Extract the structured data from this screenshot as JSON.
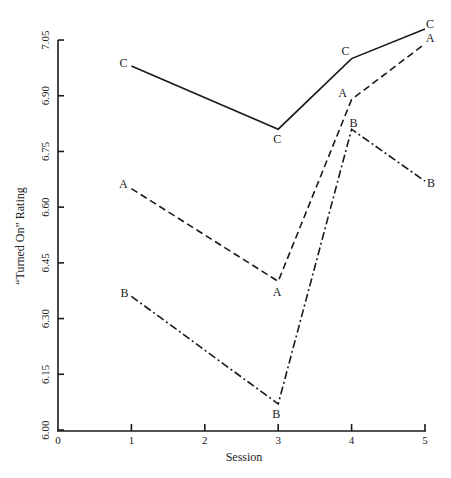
{
  "chart_data": {
    "type": "line",
    "title": "",
    "xlabel": "Session",
    "ylabel": "“Turned On” Rating",
    "xlim": [
      0,
      5
    ],
    "ylim": [
      6.0,
      7.05
    ],
    "x_ticks": [
      "0",
      "1",
      "2",
      "3",
      "4",
      "5"
    ],
    "y_ticks": [
      "6.00",
      "6.15",
      "6.30",
      "6.45",
      "6.60",
      "6.75",
      "6.90",
      "7.05"
    ],
    "grid": false,
    "legend": "none (series labeled inline at each point with letters A, B, C)",
    "x": [
      1,
      3,
      4,
      5
    ],
    "series": [
      {
        "name": "C",
        "style": "solid",
        "values": [
          6.98,
          6.81,
          7.0,
          7.08
        ]
      },
      {
        "name": "A",
        "style": "dashed",
        "values": [
          6.65,
          6.4,
          6.89,
          7.04
        ]
      },
      {
        "name": "B",
        "style": "dash-dot",
        "values": [
          6.36,
          6.07,
          6.81,
          6.67
        ]
      }
    ]
  },
  "axes": {
    "x_title": "Session",
    "y_title": "“Turned On” Rating"
  }
}
